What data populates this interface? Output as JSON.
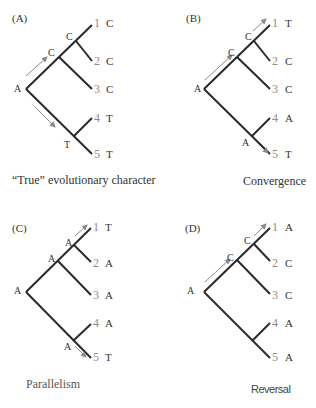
{
  "colors": {
    "branch": "#2a2a2a",
    "arrow": "#8a8a8a",
    "tip_number": "#8c8c8c",
    "text": "#333333"
  },
  "panels": [
    {
      "id": "A",
      "label": "(A)",
      "caption": "“True” evolutionary character",
      "root_state": "A",
      "internal_nodes": [
        "C",
        "C",
        "T"
      ],
      "tips": [
        {
          "num": "1",
          "state": "C"
        },
        {
          "num": "2",
          "state": "C"
        },
        {
          "num": "3",
          "state": "C"
        },
        {
          "num": "4",
          "state": "T"
        },
        {
          "num": "5",
          "state": "T"
        }
      ]
    },
    {
      "id": "B",
      "label": "(B)",
      "caption": "Convergence",
      "root_state": "A",
      "internal_nodes": [
        "C",
        "C",
        "A"
      ],
      "tips": [
        {
          "num": "1",
          "state": "T"
        },
        {
          "num": "2",
          "state": "C"
        },
        {
          "num": "3",
          "state": "C"
        },
        {
          "num": "4",
          "state": "A"
        },
        {
          "num": "5",
          "state": "T"
        }
      ]
    },
    {
      "id": "C",
      "label": "(C)",
      "caption": "Parallelism",
      "root_state": "A",
      "internal_nodes": [
        "A",
        "A",
        "A"
      ],
      "tips": [
        {
          "num": "1",
          "state": "T"
        },
        {
          "num": "2",
          "state": "A"
        },
        {
          "num": "3",
          "state": "A"
        },
        {
          "num": "4",
          "state": "A"
        },
        {
          "num": "5",
          "state": "T"
        }
      ]
    },
    {
      "id": "D",
      "label": "(D)",
      "caption": "Reversal",
      "root_state": "A",
      "internal_nodes": [
        "C",
        "C"
      ],
      "tips": [
        {
          "num": "1",
          "state": "A"
        },
        {
          "num": "2",
          "state": "C"
        },
        {
          "num": "3",
          "state": "C"
        },
        {
          "num": "4",
          "state": "A"
        },
        {
          "num": "5",
          "state": "A"
        }
      ]
    }
  ]
}
